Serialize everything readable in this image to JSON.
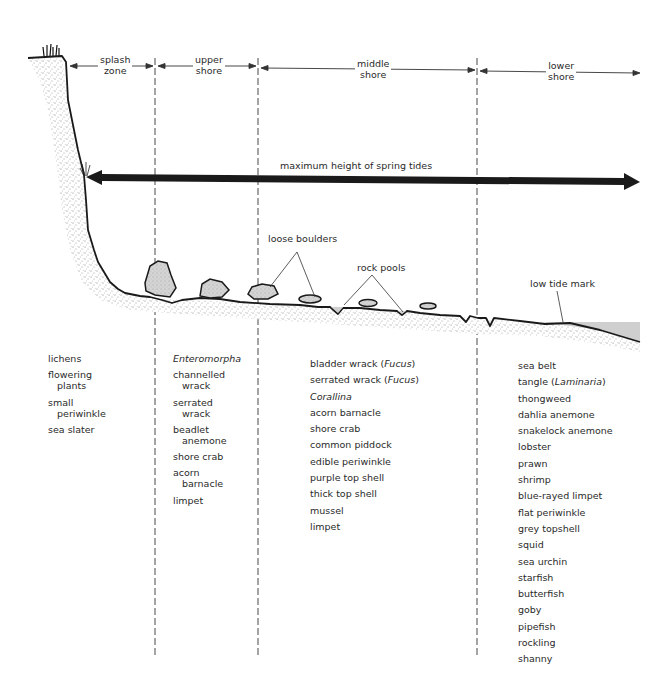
{
  "zones": [
    {
      "id": "splash",
      "line1": "splash",
      "line2": "zone"
    },
    {
      "id": "upper",
      "line1": "upper",
      "line2": "shore"
    },
    {
      "id": "middle",
      "line1": "middle",
      "line2": "shore"
    },
    {
      "id": "lower",
      "line1": "lower",
      "line2": "shore"
    }
  ],
  "annotations": {
    "spring_tides": "maximum height of spring tides",
    "loose_boulders": "loose boulders",
    "rock_pools": "rock pools",
    "low_tide_mark": "low tide mark"
  },
  "colors": {
    "ink": "#1a1a1a",
    "sand_stipple": "#8a8a8a",
    "boulder_fill": "#d0d0d0",
    "water": "#cfcfcf"
  },
  "species": {
    "splash_zone": [
      {
        "a": "lichens"
      },
      {
        "a": "flowering",
        "b": "plants"
      },
      {
        "a": "small",
        "b": "periwinkle"
      },
      {
        "a": "sea slater"
      }
    ],
    "upper_shore": [
      {
        "a": "Enteromorpha",
        "italic": true
      },
      {
        "a": "channelled",
        "b": "wrack"
      },
      {
        "a": "serrated",
        "b": "wrack"
      },
      {
        "a": "beadlet",
        "b": "anemone"
      },
      {
        "a": "shore crab"
      },
      {
        "a": "acorn",
        "b": "barnacle"
      },
      {
        "a": "limpet"
      }
    ],
    "middle_shore": [
      {
        "a": "bladder wrack (",
        "i": "Fucus",
        "c": ")"
      },
      {
        "a": "serrated wrack (",
        "i": "Fucus",
        "c": ")"
      },
      {
        "a": "Corallina",
        "italic": true
      },
      {
        "a": "acorn barnacle"
      },
      {
        "a": "shore crab"
      },
      {
        "a": "common piddock"
      },
      {
        "a": "edible periwinkle"
      },
      {
        "a": "purple top shell"
      },
      {
        "a": "thick top shell"
      },
      {
        "a": "mussel"
      },
      {
        "a": "limpet"
      }
    ],
    "lower_shore": [
      {
        "a": "sea belt"
      },
      {
        "a": "tangle (",
        "i": "Laminaria",
        "c": ")"
      },
      {
        "a": "thongweed"
      },
      {
        "a": "dahlia anemone"
      },
      {
        "a": "snakelock anemone"
      },
      {
        "a": "lobster"
      },
      {
        "a": "prawn"
      },
      {
        "a": "shrimp"
      },
      {
        "a": "blue-rayed limpet"
      },
      {
        "a": "flat periwinkle"
      },
      {
        "a": "grey topshell"
      },
      {
        "a": "squid"
      },
      {
        "a": "sea urchin"
      },
      {
        "a": "starfish"
      },
      {
        "a": "butterfish"
      },
      {
        "a": "goby"
      },
      {
        "a": "pipefish"
      },
      {
        "a": "rockling"
      },
      {
        "a": "shanny"
      }
    ]
  }
}
